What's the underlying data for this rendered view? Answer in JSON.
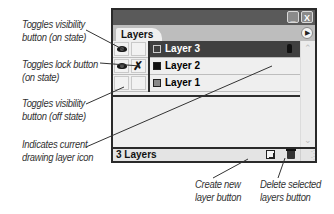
{
  "panel": {
    "tab_label": "Layers",
    "window_buttons": {
      "minimize": "_",
      "close": "X"
    },
    "menu_icon": "panel-menu-arrow-icon",
    "layers": [
      {
        "name": "Layer 3",
        "selected": true,
        "visible": true,
        "locked": false,
        "swatch_color": "#404040",
        "current_drawing": true
      },
      {
        "name": "Layer 2",
        "selected": false,
        "visible": true,
        "locked": true,
        "swatch_color": "#111111",
        "current_drawing": false
      },
      {
        "name": "Layer 1",
        "selected": false,
        "visible": false,
        "locked": false,
        "swatch_color": "#8a8a8a",
        "current_drawing": false
      }
    ],
    "status_text": "3 Layers",
    "footer_buttons": {
      "new_layer": "new-layer-icon",
      "delete_layer": "trash-icon"
    }
  },
  "callouts": {
    "visibility_on": [
      "Toggles visibility",
      "button (on state)"
    ],
    "lock_on": [
      "Toggles lock button",
      "(on state)"
    ],
    "visibility_off": [
      "Toggles visibility",
      "button (off state)"
    ],
    "current_drawing": [
      "Indicates current",
      "drawing layer icon"
    ],
    "create_new": [
      "Create new",
      "layer button"
    ],
    "delete_selected": [
      "Delete selected",
      "layers button"
    ]
  },
  "colors": {
    "title_bar": "#5a5a5a",
    "selected_row": "#404040",
    "panel_bg": "#ededed"
  }
}
